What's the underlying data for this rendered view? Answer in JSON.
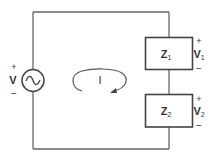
{
  "diagram": {
    "type": "series AC circuit",
    "source": {
      "label": "V",
      "plus": "+",
      "minus": "−",
      "symbol": "ac-sine"
    },
    "loop_current": {
      "label": "I",
      "direction": "clockwise"
    },
    "impedances": [
      {
        "name": "Z",
        "sub": "1",
        "voltage": "V",
        "voltage_sub": "1",
        "plus": "+",
        "minus": "−"
      },
      {
        "name": "Z",
        "sub": "2",
        "voltage": "V",
        "voltage_sub": "2",
        "plus": "+",
        "minus": "−"
      }
    ],
    "colors": {
      "wire": "#555555",
      "box": "#444444",
      "text": "#333333",
      "background": "#ffffff"
    }
  }
}
